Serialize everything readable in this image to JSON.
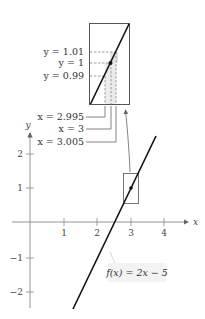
{
  "diagram": {
    "function_label": "f(x) = 2x − 5",
    "axis_labels": {
      "x": "x",
      "y": "y"
    },
    "x_ticks": [
      "1",
      "2",
      "3",
      "4"
    ],
    "y_ticks": [
      "2",
      "1",
      "−1",
      "−2"
    ],
    "zoom_labels": {
      "y_upper": "y = 1.01",
      "y_mid": "y = 1",
      "y_lower": "y = 0.99",
      "x_left": "x = 2.995",
      "x_mid": "x = 3",
      "x_right": "x = 3.005"
    },
    "point": {
      "x": 3,
      "y": 1
    },
    "colors": {
      "line": "#111111",
      "axis": "#777777",
      "box": "#555555",
      "shade": "#e4e4e4",
      "dash": "#888888"
    }
  }
}
